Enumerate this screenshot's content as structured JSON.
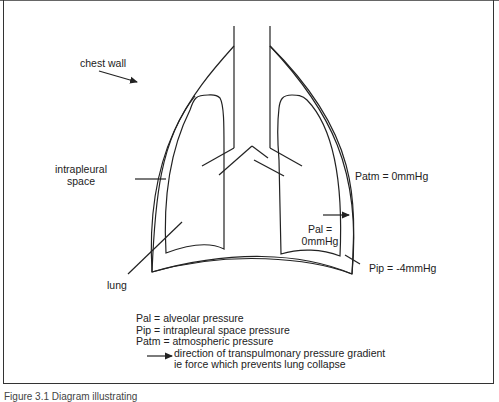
{
  "diagram": {
    "labels": {
      "chest_wall": "chest wall",
      "intrapleural_space_line1": "intrapleural",
      "intrapleural_space_line2": "space",
      "lung": "lung",
      "patm": "Patm = 0mmHg",
      "pal_line1": "Pal =",
      "pal_line2": "0mmHg",
      "pip": "Pip = -4mmHg"
    },
    "legend": {
      "items": [
        "Pal = alveolar pressure",
        "Pip = intrapleural space pressure",
        "Patm = atmospheric pressure"
      ],
      "arrow_line1": "direction of transpulmonary pressure gradient",
      "arrow_line2": "ie force which prevents lung collapse"
    },
    "caption": "Figure 3.1 Diagram illustrating"
  }
}
